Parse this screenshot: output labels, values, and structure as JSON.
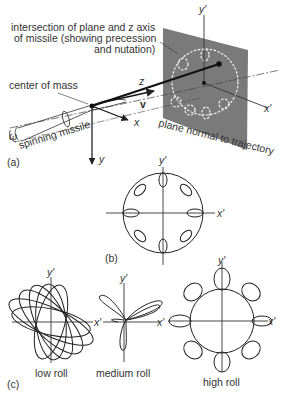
{
  "panel_a": {
    "tag": "(a)",
    "annotation_intersection_line1": "intersection of plane and z axis",
    "annotation_intersection_line2": "of missile (showing precession",
    "annotation_intersection_line3": "and nutation)",
    "label_center_of_mass": "center of mass",
    "label_spinning_missile": "spinning missile",
    "label_plane": "plane normal to trajectory",
    "axis_z": "z",
    "axis_x": "x",
    "axis_y": "y",
    "axis_v": "v",
    "axis_omega": "ω",
    "axis_x_prime": "x′",
    "axis_y_prime": "y′",
    "plane_color": "#7a7a7a"
  },
  "panel_b": {
    "tag": "(b)",
    "axis_x_prime": "x′",
    "axis_y_prime": "y′",
    "loops": 8
  },
  "panel_c": {
    "tag": "(c)",
    "plots": [
      {
        "label": "low roll",
        "axis_x_prime": "x′",
        "axis_y_prime": "y′"
      },
      {
        "label": "medium roll",
        "axis_x_prime": "x′",
        "axis_y_prime": "y′"
      },
      {
        "label": "high roll",
        "axis_x_prime": "x′",
        "axis_y_prime": "y′"
      }
    ]
  }
}
